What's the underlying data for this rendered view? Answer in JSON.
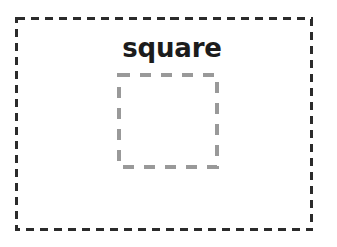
{
  "canvas": {
    "width": 337,
    "height": 247,
    "background_color": "#ffffff"
  },
  "outer_frame": {
    "name": "image-boundary",
    "stroke_color": "#2b2b2b",
    "stroke_width": 3,
    "dash_pattern": "8 6",
    "fill": "none",
    "x": 15,
    "y": 17,
    "width": 298,
    "height": 214
  },
  "annotation": {
    "label": "square",
    "text_color": "#1c1c1c",
    "font_size": "26px",
    "font_weight": "bold",
    "x": 118,
    "y": 38
  },
  "shape": {
    "name": "square",
    "stroke_color": "#999999",
    "stroke_width": 4,
    "dash_pattern": "11 10",
    "fill": "none",
    "x": 117,
    "y": 73,
    "width": 102,
    "height": 96
  }
}
